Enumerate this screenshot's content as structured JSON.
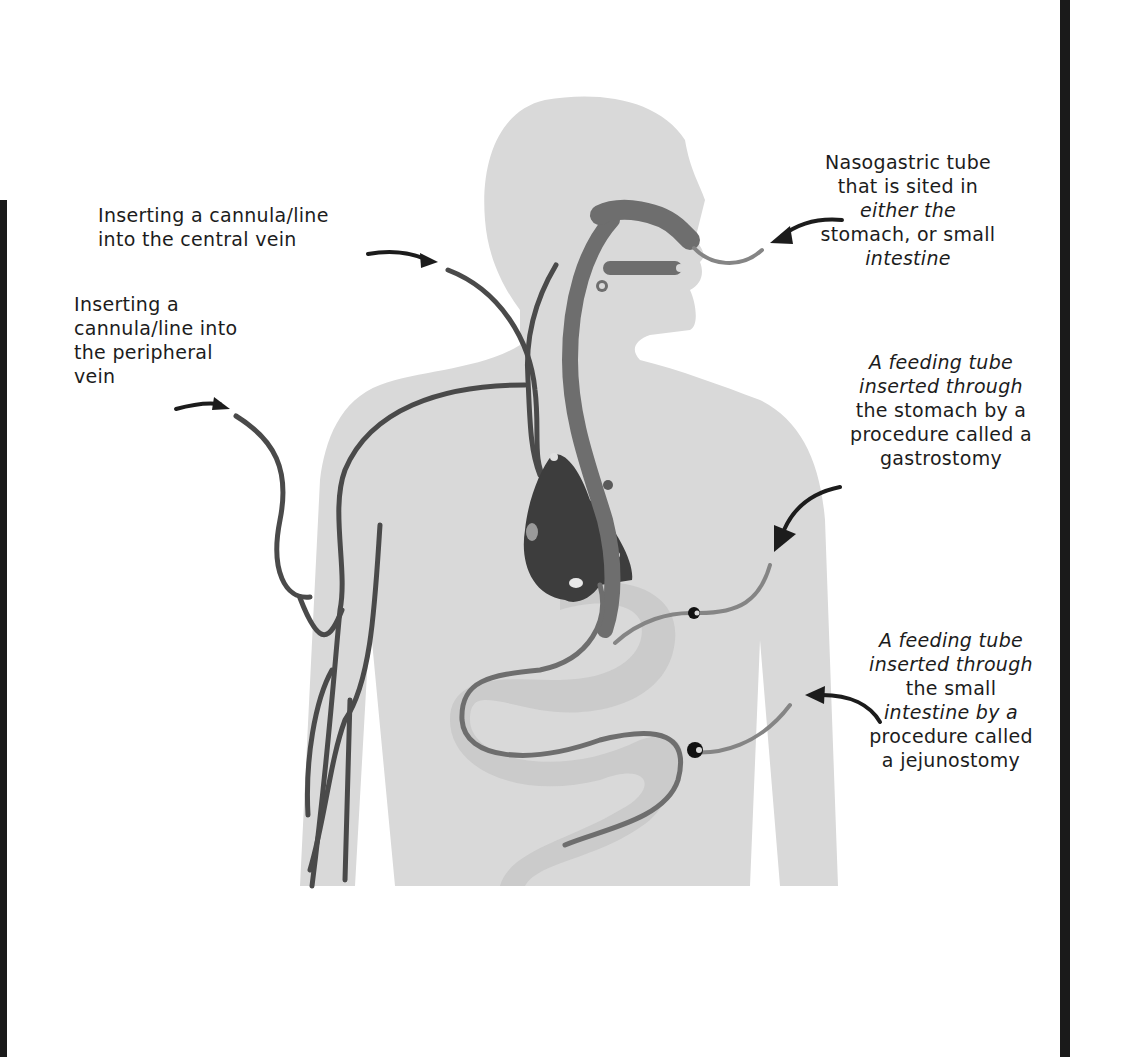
{
  "diagram": {
    "colors": {
      "silhouette": "#d9d9d9",
      "vein": "#4a4a4a",
      "tube_dark": "#6e6e6e",
      "tube_light": "#858585",
      "heart": "#3d3d3d",
      "stomach": "#c9c9c9",
      "frame": "#1a1a1a",
      "arrow": "#1c1c1c"
    },
    "labels": {
      "central_vein": {
        "lines": [
          "Inserting  a  cannula/line",
          "into the central vein"
        ]
      },
      "peripheral_vein": {
        "lines": [
          "Inserting a",
          "cannula/line into",
          "the peripheral",
          "vein"
        ]
      },
      "nasogastric": {
        "lines": [
          "Nasogastric tube",
          "that is sited in",
          "either the",
          "stomach, or small",
          "intestine"
        ]
      },
      "gastrostomy": {
        "lines": [
          "A feeding tube",
          "inserted through",
          "the stomach by a",
          "procedure called a",
          "gastrostomy"
        ]
      },
      "jejunostomy": {
        "lines": [
          "A feeding tube",
          "inserted through",
          "the small",
          "intestine by a",
          "procedure called",
          "a jejunostomy"
        ]
      }
    }
  }
}
